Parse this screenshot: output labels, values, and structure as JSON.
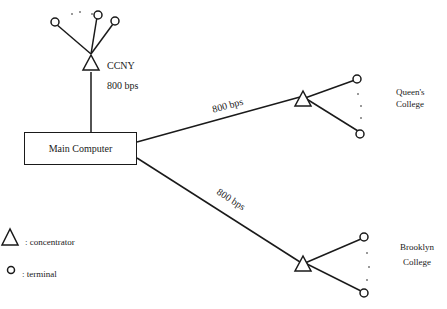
{
  "diagram": {
    "main_node": {
      "label": "Main Computer"
    },
    "sites": [
      {
        "name": "CCNY",
        "link_rate": "800 bps"
      },
      {
        "name_line1": "Queen's",
        "name_line2": "College",
        "link_rate": "800 bps"
      },
      {
        "name_line1": "Brooklyn",
        "name_line2": "College",
        "link_rate": "800 bps"
      }
    ],
    "legend": {
      "concentrator": ": concentrator",
      "terminal": ": terminal"
    },
    "colors": {
      "stroke": "#1a1a1a",
      "background": "#ffffff"
    }
  }
}
